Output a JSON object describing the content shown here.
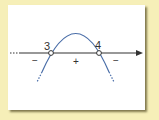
{
  "diagram": {
    "type": "sign-chart",
    "roots": [
      {
        "label": "3"
      },
      {
        "label": "4"
      }
    ],
    "signs": [
      {
        "region": "left",
        "label": "−"
      },
      {
        "region": "middle",
        "label": "+"
      },
      {
        "region": "right",
        "label": "−"
      }
    ],
    "colors": {
      "background": "#f6efb8",
      "card": "#ffffff",
      "axis": "#333333",
      "curve": "#4a6ea8",
      "text": "#333333"
    }
  }
}
